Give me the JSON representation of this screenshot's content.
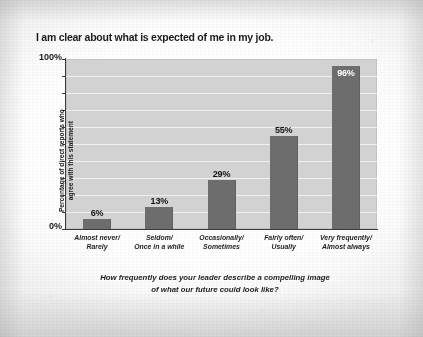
{
  "chart_data": {
    "type": "bar",
    "title": "I am clear about what is expected of me in my job.",
    "categories": [
      "Almost never/ Rarely",
      "Seldom/ Once in a while",
      "Occasionally/ Sometimes",
      "Fairly often/ Usually",
      "Very frequently/ Almost always"
    ],
    "category_lines": [
      [
        "Almost never/",
        "Rarely"
      ],
      [
        "Seldom/",
        "Once in a while"
      ],
      [
        "Occasionally/",
        "Sometimes"
      ],
      [
        "Fairly often/",
        "Usually"
      ],
      [
        "Very frequently/",
        "Almost always"
      ]
    ],
    "values": [
      6,
      13,
      29,
      55,
      96
    ],
    "value_labels": [
      "6%",
      "13%",
      "29%",
      "55%",
      "96%"
    ],
    "ylabel_lines": [
      "Percentage of direct reports who",
      "agree with this statement"
    ],
    "ylabel": "Percentage of direct reports who agree with this statement",
    "xlabel_lines": [
      "How frequently does your leader describe a compelling image",
      "of what our future could look like?"
    ],
    "xlabel": "How frequently does your leader describe a compelling image of what our future could look like?",
    "ylim": [
      0,
      100
    ],
    "ytick_top": "100%",
    "ytick_bottom": "0%",
    "ytick_step": 10,
    "grid": "horizontal-white",
    "legend": "none",
    "colors": {
      "bar": "#6d6d6d",
      "plot_background": "#d2d2d2",
      "gridline": "#f0f0f0",
      "axis": "#3a3a3a",
      "text": "#1b1b1b",
      "inside_label": "#ffffff",
      "page_background": "#ffffff"
    }
  }
}
